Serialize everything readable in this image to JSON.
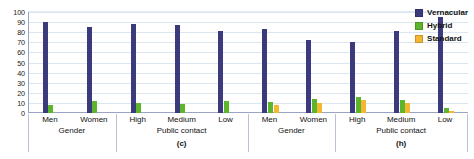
{
  "chart_data": {
    "type": "bar",
    "title": "",
    "xlabel": "",
    "ylabel": "",
    "ylim": [
      0,
      100
    ],
    "ytick_step": 10,
    "yticks": [
      "100",
      "90",
      "80",
      "70",
      "60",
      "50",
      "40",
      "30",
      "20",
      "10",
      "0"
    ],
    "grid": true,
    "legend_position": "top-right",
    "legend": [
      {
        "name": "Vernacular",
        "color": "#3a3a7d"
      },
      {
        "name": "Hybrid",
        "color": "#5cb52b"
      },
      {
        "name": "Standard",
        "color": "#f5b731"
      }
    ],
    "panels": [
      {
        "panel_label": "(c)",
        "groups": [
          {
            "group_label": "Gender",
            "categories": [
              "Men",
              "Women"
            ],
            "series": [
              {
                "name": "Vernacular",
                "values": [
                  90,
                  85
                ]
              },
              {
                "name": "Hybrid",
                "values": [
                  8,
                  12
                ]
              },
              {
                "name": "Standard",
                "values": [
                  0,
                  0
                ]
              }
            ]
          },
          {
            "group_label": "Public contact",
            "categories": [
              "High",
              "Medium",
              "Low"
            ],
            "series": [
              {
                "name": "Vernacular",
                "values": [
                  88,
                  87,
                  81
                ]
              },
              {
                "name": "Hybrid",
                "values": [
                  10,
                  9,
                  12
                ]
              },
              {
                "name": "Standard",
                "values": [
                  0,
                  0,
                  0
                ]
              }
            ]
          }
        ]
      },
      {
        "panel_label": "(h)",
        "groups": [
          {
            "group_label": "Gender",
            "categories": [
              "Men",
              "Women"
            ],
            "series": [
              {
                "name": "Vernacular",
                "values": [
                  83,
                  72
                ]
              },
              {
                "name": "Hybrid",
                "values": [
                  11,
                  14
                ]
              },
              {
                "name": "Standard",
                "values": [
                  8,
                  10
                ]
              }
            ]
          },
          {
            "group_label": "Public contact",
            "categories": [
              "High",
              "Medium",
              "Low"
            ],
            "series": [
              {
                "name": "Vernacular",
                "values": [
                  70,
                  81,
                  95
                ]
              },
              {
                "name": "Hybrid",
                "values": [
                  16,
                  13,
                  5
                ]
              },
              {
                "name": "Standard",
                "values": [
                  13,
                  10,
                  2
                ]
              }
            ]
          }
        ]
      }
    ]
  }
}
